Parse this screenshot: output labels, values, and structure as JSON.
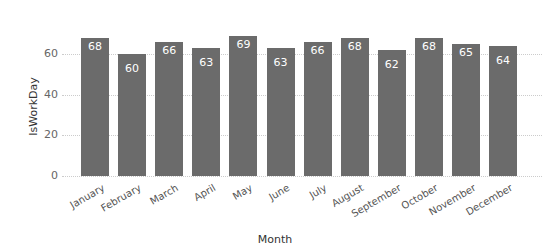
{
  "chart_data": {
    "type": "bar",
    "title": "",
    "xlabel": "Month",
    "ylabel": "IsWorkDay",
    "categories": [
      "January",
      "February",
      "March",
      "April",
      "May",
      "June",
      "July",
      "August",
      "September",
      "October",
      "November",
      "December"
    ],
    "values": [
      68,
      60,
      66,
      63,
      69,
      63,
      66,
      68,
      62,
      68,
      65,
      64
    ],
    "yticks": [
      0,
      20,
      40,
      60
    ],
    "ylim": [
      0,
      70
    ],
    "grid": true,
    "bar_color": "#6b6b6b",
    "data_labels": true,
    "legend": "none"
  }
}
